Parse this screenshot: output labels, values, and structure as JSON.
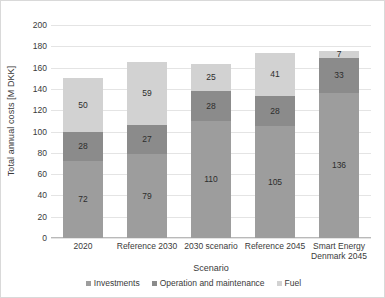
{
  "chart_data": {
    "type": "bar",
    "stacked": true,
    "title": "",
    "xlabel": "Scenario",
    "ylabel": "Total annual costs [M DKK]",
    "ylim": [
      0,
      200
    ],
    "ytick_step": 20,
    "yticks": [
      200,
      180,
      160,
      140,
      120,
      100,
      80,
      60,
      40,
      20,
      0
    ],
    "grid": "horizontal",
    "legend_position": "bottom",
    "categories": [
      "2020",
      "Reference 2030",
      "2030 scenario",
      "Reference 2045",
      "Smart Energy Denmark 2045"
    ],
    "series": [
      {
        "name": "Investments",
        "color": "#9d9d9d",
        "values": [
          72,
          79,
          110,
          105,
          136
        ]
      },
      {
        "name": "Operation and maintenance",
        "color": "#8b8b8b",
        "values": [
          28,
          27,
          28,
          28,
          33
        ]
      },
      {
        "name": "Fuel",
        "color": "#d2d2d2",
        "values": [
          50,
          59,
          25,
          41,
          7
        ]
      }
    ],
    "totals": [
      150,
      165,
      163,
      174,
      176
    ]
  }
}
